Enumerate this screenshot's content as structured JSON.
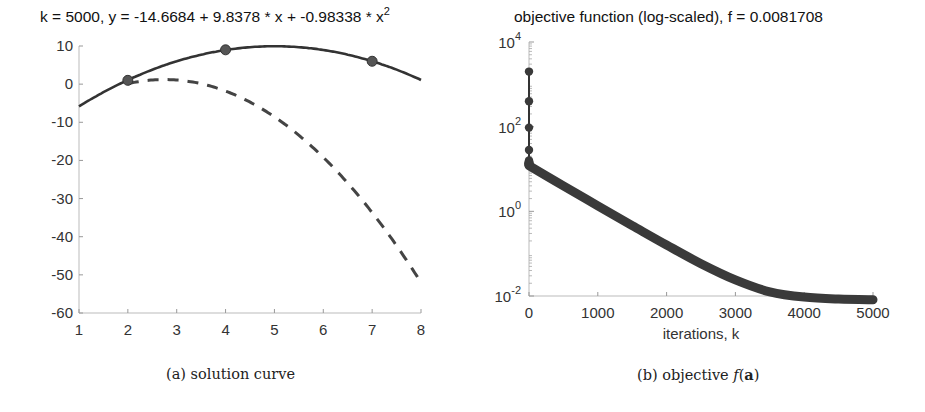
{
  "figure": {
    "captions": {
      "a": "(a) solution curve",
      "b_prefix": "(b) objective ",
      "b_math_f": "f",
      "b_math_arg": "(",
      "b_math_bold": "a",
      "b_math_close": ")"
    }
  },
  "chart_data": [
    {
      "id": "a",
      "type": "line",
      "title": "k = 5000, y = -14.6684 + 9.8378 * x + -0.98338 * x",
      "title_superscript": "2",
      "xlabel": "",
      "ylabel": "",
      "xlim": [
        1,
        8
      ],
      "ylim": [
        -60,
        10
      ],
      "xticks": [
        1,
        2,
        3,
        4,
        5,
        6,
        7,
        8
      ],
      "yticks": [
        10,
        0,
        -10,
        -20,
        -30,
        -40,
        -50,
        -60
      ],
      "grid": false,
      "series": [
        {
          "name": "fitted curve (k = 5000)",
          "style": "solid",
          "color": "#333333",
          "coefficients": [
            -14.6684,
            9.8378,
            -0.98338
          ],
          "x_range": [
            1,
            8
          ]
        },
        {
          "name": "initial curve",
          "style": "dashed",
          "color": "#444444",
          "coefficients": [
            -13.396,
            10.615,
            -1.93
          ],
          "x_range": [
            2,
            8
          ]
        }
      ],
      "points": [
        {
          "x": 2,
          "y": 1
        },
        {
          "x": 4,
          "y": 9
        },
        {
          "x": 7,
          "y": 6
        }
      ]
    },
    {
      "id": "b",
      "type": "scatter",
      "title": "objective function (log-scaled), f = 0.0081708",
      "xlabel": "iterations, k",
      "ylabel": "",
      "yscale": "log",
      "xlim": [
        0,
        5000
      ],
      "ylim": [
        0.01,
        10000
      ],
      "xticks": [
        0,
        1000,
        2000,
        3000,
        4000,
        5000
      ],
      "yticks": [
        {
          "value": 10000,
          "base": "10",
          "exp": "4"
        },
        {
          "value": 100,
          "base": "10",
          "exp": "2"
        },
        {
          "value": 1,
          "base": "10",
          "exp": "0"
        },
        {
          "value": 0.01,
          "base": "10",
          "exp": "-2"
        }
      ],
      "grid": false,
      "color": "#333333",
      "initial_points": [
        {
          "k": 0,
          "f": 2000
        },
        {
          "k": 0,
          "f": 400
        },
        {
          "k": 0,
          "f": 95
        },
        {
          "k": 0,
          "f": 28
        },
        {
          "k": 0,
          "f": 16
        }
      ],
      "series": [
        {
          "k": 0,
          "f": 12
        },
        {
          "k": 500,
          "f": 4.0
        },
        {
          "k": 1000,
          "f": 1.35
        },
        {
          "k": 1500,
          "f": 0.46
        },
        {
          "k": 2000,
          "f": 0.16
        },
        {
          "k": 2500,
          "f": 0.058
        },
        {
          "k": 3000,
          "f": 0.024
        },
        {
          "k": 3500,
          "f": 0.0125
        },
        {
          "k": 4000,
          "f": 0.0094
        },
        {
          "k": 4500,
          "f": 0.0085
        },
        {
          "k": 5000,
          "f": 0.0081708
        }
      ],
      "final_value": 0.0081708
    }
  ]
}
